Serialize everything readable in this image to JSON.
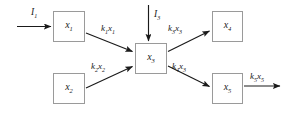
{
  "diagram": {
    "type": "compartmental-flow-diagram",
    "background_color": "#ffffff",
    "line_color": "#1a1a1a",
    "box_border_color": "#9a9a9a",
    "nodes": [
      {
        "id": "x1",
        "base": "x",
        "sub": "1",
        "x": 53,
        "y": 11,
        "w": 32,
        "h": 31
      },
      {
        "id": "x2",
        "base": "x",
        "sub": "2",
        "x": 53,
        "y": 73,
        "w": 32,
        "h": 31
      },
      {
        "id": "x3",
        "base": "x",
        "sub": "3",
        "x": 135,
        "y": 43,
        "w": 32,
        "h": 31
      },
      {
        "id": "x4",
        "base": "x",
        "sub": "4",
        "x": 212,
        "y": 11,
        "w": 31,
        "h": 31
      },
      {
        "id": "x5",
        "base": "x",
        "sub": "5",
        "x": 212,
        "y": 73,
        "w": 31,
        "h": 31
      }
    ],
    "inputs": [
      {
        "id": "I1",
        "base": "I",
        "sub": "1",
        "label_x": 31,
        "label_y": 8
      },
      {
        "id": "I3",
        "base": "I",
        "sub": "3",
        "label_x": 154,
        "label_y": 10
      }
    ],
    "edges": [
      {
        "id": "k1x1",
        "base": "k",
        "sub": "1",
        "base2": "x",
        "sub2": "1",
        "label_x": 101,
        "label_y": 24,
        "from": "x1",
        "to": "x3"
      },
      {
        "id": "k2x2",
        "base": "k",
        "sub": "2",
        "base2": "x",
        "sub2": "2",
        "label_x": 91,
        "label_y": 62,
        "from": "x2",
        "to": "x3"
      },
      {
        "id": "k3x3",
        "base": "k",
        "sub": "3",
        "base2": "x",
        "sub2": "3",
        "label_x": 168,
        "label_y": 24,
        "from": "x3",
        "to": "x4"
      },
      {
        "id": "k4x3",
        "base": "k",
        "sub": "4",
        "base2": "x",
        "sub2": "3",
        "label_x": 172,
        "label_y": 62,
        "from": "x3",
        "to": "x5"
      },
      {
        "id": "k5x5",
        "base": "k",
        "sub": "5",
        "base2": "x",
        "sub2": "5",
        "label_x": 250,
        "label_y": 72,
        "from": "x5",
        "to": "outflow"
      }
    ]
  }
}
